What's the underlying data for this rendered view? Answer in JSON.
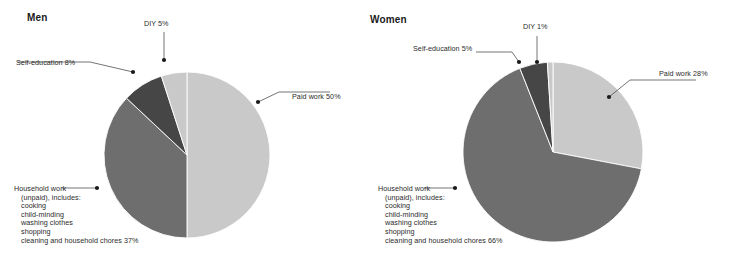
{
  "canvas": {
    "width": 730,
    "height": 268,
    "background": "#ffffff"
  },
  "colors": {
    "paid_work": "#c9c9c9",
    "household": "#6e6e6e",
    "self_education": "#464646",
    "diy": "#c9c9c9",
    "leader_line": "#3a3a3a",
    "marker": "#1a1a1a",
    "text": "#2b2b2b",
    "title": "#1a1a1a"
  },
  "panels": [
    {
      "id": "men",
      "title": "Men",
      "title_x": 27,
      "title_y": 12,
      "cx": 187,
      "cy": 155,
      "r": 83,
      "slices": [
        {
          "name": "paid-work",
          "label": "Paid work 50%",
          "value": 50,
          "color": "#c9c9c9"
        },
        {
          "name": "household-work",
          "label": "Household work (unpaid), includes: cooking, child-minding, washing clothes, shopping, cleaning and household chores 37%",
          "value": 37,
          "color": "#6e6e6e"
        },
        {
          "name": "self-education",
          "label": "Self-education 8%",
          "value": 8,
          "color": "#464646"
        },
        {
          "name": "diy",
          "label": "DIY 5%",
          "value": 5,
          "color": "#c9c9c9"
        }
      ],
      "callouts": [
        {
          "name": "paid-work",
          "kind": "single",
          "text": "Paid work 50%",
          "text_x": 292,
          "text_y": 93,
          "marker": {
            "x": 258,
            "y": 102
          },
          "path": "M258,102 L279,92 L330,92"
        },
        {
          "name": "diy",
          "kind": "single",
          "text": "DIY 5%",
          "text_x": 144,
          "text_y": 20,
          "marker": {
            "x": 164,
            "y": 60
          },
          "path": "M164,60 L164,32"
        },
        {
          "name": "self-education",
          "kind": "single",
          "text": "Self-education 8%",
          "text_x": 16,
          "text_y": 59,
          "marker": {
            "x": 133,
            "y": 72
          },
          "path": "M133,72 L90,62 L18,62"
        },
        {
          "name": "household-work",
          "kind": "block",
          "lines": [
            "Household work",
            "(unpaid), includes:",
            "cooking",
            "child-minding",
            "washing clothes",
            "shopping",
            "cleaning and household chores 37%"
          ],
          "text_x": 14,
          "text_y": 185,
          "marker": {
            "x": 97,
            "y": 188
          },
          "path": "M97,188 L84,188 L62,188"
        }
      ]
    },
    {
      "id": "women",
      "title": "Women",
      "title_x": 370,
      "title_y": 14,
      "cx": 553,
      "cy": 152,
      "r": 90,
      "slices": [
        {
          "name": "paid-work",
          "label": "Paid work 28%",
          "value": 28,
          "color": "#c9c9c9"
        },
        {
          "name": "household-work",
          "label": "Household work (unpaid), includes: cooking, child-minding, washing clothes, shopping, cleaning and household chores 66%",
          "value": 66,
          "color": "#6e6e6e"
        },
        {
          "name": "self-education",
          "label": "Self-education 5%",
          "value": 5,
          "color": "#464646"
        },
        {
          "name": "diy",
          "label": "DIY 1%",
          "value": 1,
          "color": "#c9c9c9"
        }
      ],
      "callouts": [
        {
          "name": "paid-work",
          "kind": "single",
          "text": "Paid work 28%",
          "text_x": 659,
          "text_y": 70,
          "marker": {
            "x": 609,
            "y": 97
          },
          "path": "M609,97 L630,80 L696,80"
        },
        {
          "name": "diy",
          "kind": "single",
          "text": "DIY 1%",
          "text_x": 523,
          "text_y": 23,
          "marker": {
            "x": 537,
            "y": 62
          },
          "path": "M537,62 L537,36"
        },
        {
          "name": "self-education",
          "kind": "single",
          "text": "Self-education 5%",
          "text_x": 413,
          "text_y": 45,
          "marker": {
            "x": 519,
            "y": 62
          },
          "path": "M519,62 L512,52 L476,52"
        },
        {
          "name": "household-work",
          "kind": "block",
          "lines": [
            "Household work",
            "(unpaid), includes:",
            "cooking",
            "child-minding",
            "washing clothes",
            "shopping",
            "cleaning and household chores 66%"
          ],
          "text_x": 378,
          "text_y": 185,
          "marker": {
            "x": 455,
            "y": 188
          },
          "path": "M455,188 L440,188 L424,188"
        }
      ]
    }
  ],
  "chart_data": {
    "type": "pie",
    "charts": [
      {
        "name": "Men",
        "categories": [
          "Paid work",
          "Household work (unpaid)",
          "Self-education",
          "DIY"
        ],
        "values": [
          50,
          37,
          8,
          5
        ],
        "unit": "%",
        "labels": [
          "Paid work 50%",
          "Household work (unpaid), includes: cooking, child-minding, washing clothes, shopping, cleaning and household chores 37%",
          "Self-education 8%",
          "DIY 5%"
        ],
        "colors": [
          "#c9c9c9",
          "#6e6e6e",
          "#464646",
          "#c9c9c9"
        ],
        "start_angle_deg": 0,
        "direction": "clockwise"
      },
      {
        "name": "Women",
        "categories": [
          "Paid work",
          "Household work (unpaid)",
          "Self-education",
          "DIY"
        ],
        "values": [
          28,
          66,
          5,
          1
        ],
        "unit": "%",
        "labels": [
          "Paid work 28%",
          "Household work (unpaid), includes: cooking, child-minding, washing clothes, shopping, cleaning and household chores 66%",
          "Self-education 5%",
          "DIY 1%"
        ],
        "colors": [
          "#c9c9c9",
          "#6e6e6e",
          "#464646",
          "#c9c9c9"
        ],
        "start_angle_deg": 0,
        "direction": "clockwise"
      }
    ],
    "legend": "none",
    "grid": false,
    "annotations": [
      "Household work (unpaid) includes: cooking, child-minding, washing clothes, shopping, cleaning and household chores"
    ]
  }
}
